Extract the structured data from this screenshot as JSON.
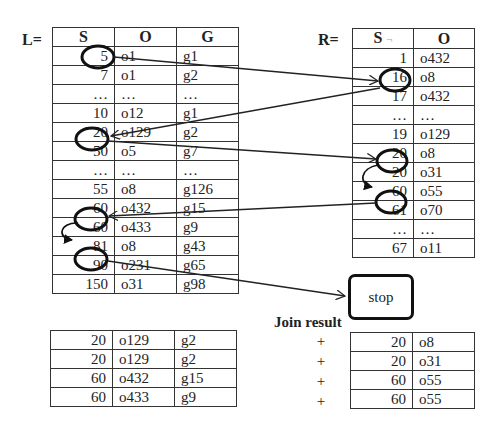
{
  "left_table": {
    "label": "L=",
    "headers": [
      "S",
      "O",
      "G"
    ],
    "rows": [
      [
        "5",
        "o1",
        "g1"
      ],
      [
        "7",
        "o1",
        "g2"
      ],
      [
        "…",
        "…",
        "…"
      ],
      [
        "10",
        "o12",
        "g1"
      ],
      [
        "20",
        "o129",
        "g2"
      ],
      [
        "50",
        "o5",
        "g7"
      ],
      [
        "…",
        "…",
        "…"
      ],
      [
        "55",
        "o8",
        "g126"
      ],
      [
        "60",
        "o432",
        "g15"
      ],
      [
        "60",
        "o433",
        "g9"
      ],
      [
        "81",
        "o8",
        "g43"
      ],
      [
        "90",
        "o231",
        "g65"
      ],
      [
        "150",
        "o31",
        "g98"
      ]
    ],
    "circled_rows": [
      0,
      4,
      8,
      10
    ]
  },
  "right_table": {
    "label": "R=",
    "headers": [
      "S",
      "O"
    ],
    "rows": [
      [
        "1",
        "o432"
      ],
      [
        "16",
        "o8"
      ],
      [
        "17",
        "o432"
      ],
      [
        "…",
        "…"
      ],
      [
        "19",
        "o129"
      ],
      [
        "20",
        "o8"
      ],
      [
        "20",
        "o31"
      ],
      [
        "60",
        "o55"
      ],
      [
        "61",
        "o70"
      ],
      [
        "…",
        "…"
      ],
      [
        "67",
        "o11"
      ]
    ],
    "circled_rows": [
      1,
      5,
      7
    ]
  },
  "stop_box": {
    "label": "stop"
  },
  "join_result": {
    "label": "Join result",
    "operator": "+",
    "left_rows": [
      [
        "20",
        "o129",
        "g2"
      ],
      [
        "20",
        "o129",
        "g2"
      ],
      [
        "60",
        "o432",
        "g15"
      ],
      [
        "60",
        "o433",
        "g9"
      ]
    ],
    "right_rows": [
      [
        "20",
        "o8"
      ],
      [
        "20",
        "o31"
      ],
      [
        "60",
        "o55"
      ],
      [
        "60",
        "o55"
      ]
    ]
  },
  "arrows": [
    {
      "from": "L.S=5",
      "to": "R.S=16"
    },
    {
      "from": "R.S=16",
      "to": "L.S=20"
    },
    {
      "from": "L.S=20",
      "to": "R.S=20"
    },
    {
      "from": "R.S=20",
      "to": "R.S=20 (next)"
    },
    {
      "from": "R.S=60",
      "to": "L.S=60"
    },
    {
      "from": "L.S=60",
      "to": "L.S=60 (next)"
    },
    {
      "from": "L.S=81",
      "to": "stop"
    }
  ]
}
